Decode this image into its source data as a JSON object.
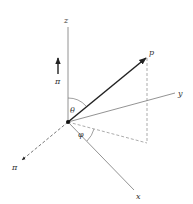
{
  "diagram": {
    "labels": {
      "z_axis": "z",
      "y_axis": "y",
      "x_axis": "x",
      "vector": "p",
      "theta": "θ",
      "phi": "φ",
      "pi_up": "π",
      "pi_dashed": "π"
    },
    "colors": {
      "axis": "#777777",
      "vector": "#222222",
      "dashed": "#888888",
      "text": "#333333"
    }
  }
}
